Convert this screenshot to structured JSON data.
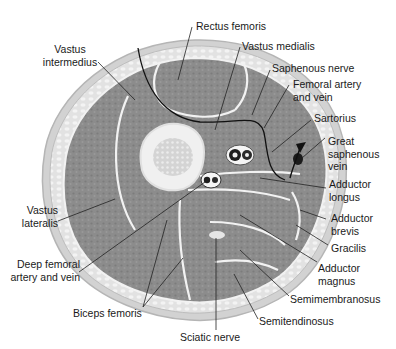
{
  "diagram": {
    "colors": {
      "muscle": "#8a8a8a",
      "muscle_dark": "#6f6f6f",
      "fat": "#e6e6e6",
      "skin": "#cfcfcf",
      "fascia": "#f4f4f4",
      "bone_cortex": "#efefef",
      "marrow": "#d8d8d8",
      "leader": "#222222",
      "text": "#1a1a1a"
    },
    "labels": {
      "rectus_femoris": "Rectus femoris",
      "vastus_intermedius": "Vastus\nintermedius",
      "vastus_medialis": "Vastus medialis",
      "saphenous_nerve": "Saphenous nerve",
      "femoral_artery_vein": "Femoral artery\nand vein",
      "sartorius": "Sartorius",
      "great_saphenous_vein": "Great\nsaphenous\nvein",
      "adductor_longus": "Adductor\nlongus",
      "adductor_brevis": "Adductor\nbrevis",
      "gracilis": "Gracilis",
      "adductor_magnus": "Adductor\nmagnus",
      "semimembranosus": "Semimembranosus",
      "semitendinosus": "Semitendinosus",
      "sciatic_nerve": "Sciatic nerve",
      "biceps_femoris": "Biceps femoris",
      "deep_femoral_artery_vein": "Deep femoral\nartery and vein",
      "vastus_lateralis": "Vastus\nlateralis"
    }
  }
}
